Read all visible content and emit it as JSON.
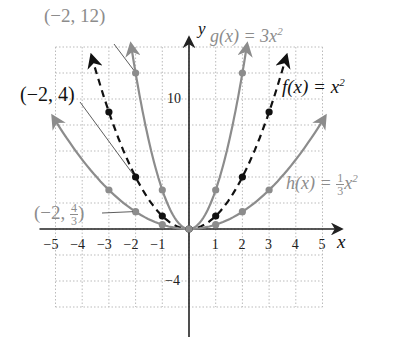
{
  "chart_data": {
    "type": "line",
    "title": "",
    "xlabel": "x",
    "ylabel": "y",
    "xlim": [
      -5,
      5
    ],
    "ylim": [
      -6,
      14
    ],
    "grid": true,
    "x_ticks": [
      "−5",
      "−4",
      "−3",
      "−2",
      "−1",
      "1",
      "2",
      "3",
      "4",
      "5"
    ],
    "y_ticks": [
      "10",
      "−4"
    ],
    "series": [
      {
        "name": "g(x) = 3x^2",
        "style": "solid",
        "color": "#8c8c8c",
        "x": [
          -2,
          -1,
          0,
          1,
          2
        ],
        "values": [
          12,
          3,
          0,
          3,
          12
        ]
      },
      {
        "name": "f(x) = x^2",
        "style": "dashed",
        "color": "#111111",
        "x": [
          -3,
          -2,
          -1,
          0,
          1,
          2,
          3
        ],
        "values": [
          9,
          4,
          1,
          0,
          1,
          4,
          9
        ]
      },
      {
        "name": "h(x) = (1/3)x^2",
        "style": "solid",
        "color": "#8c8c8c",
        "x": [
          -3,
          -2,
          -1,
          0,
          1,
          2,
          3
        ],
        "values": [
          3,
          1.333,
          0.333,
          0,
          0.333,
          1.333,
          3
        ]
      }
    ],
    "annotations": [
      {
        "text": "(−2, 12)",
        "point": [
          -2,
          12
        ]
      },
      {
        "text": "(−2, 4)",
        "point": [
          -2,
          4
        ]
      },
      {
        "text": "(−2, 4/3)",
        "point": [
          -2,
          1.333
        ]
      }
    ]
  },
  "labels": {
    "g": {
      "fn": "g(x) = 3x",
      "exp": "2"
    },
    "f": {
      "fn": "f(x) = x",
      "exp": "2"
    },
    "h": {
      "fn": "h(x) = ",
      "num": "1",
      "den": "3",
      "var": "x",
      "exp": "2"
    },
    "ann_g": "(−2, 12)",
    "ann_f": "(−2, 4)",
    "ann_h_pre": "(−2, ",
    "ann_h_num": "4",
    "ann_h_den": "3",
    "ann_h_post": ")",
    "axis_x": "x",
    "axis_y": "y"
  }
}
